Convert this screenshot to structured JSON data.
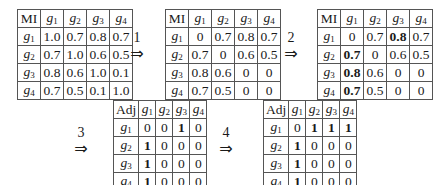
{
  "steps": [
    {
      "label": "1",
      "arrow": "⇒"
    },
    {
      "label": "2",
      "arrow": "⇒"
    },
    {
      "label": "3",
      "arrow": "⇒"
    },
    {
      "label": "4",
      "arrow": "⇒"
    }
  ],
  "matrices": [
    {
      "corner": "MI",
      "col_headers": [
        {
          "base": "g",
          "sub": "1"
        },
        {
          "base": "g",
          "sub": "2"
        },
        {
          "base": "g",
          "sub": "3"
        },
        {
          "base": "g",
          "sub": "4"
        }
      ],
      "row_headers": [
        {
          "base": "g",
          "sub": "1"
        },
        {
          "base": "g",
          "sub": "2"
        },
        {
          "base": "g",
          "sub": "3"
        },
        {
          "base": "g",
          "sub": "4"
        }
      ],
      "rows": [
        [
          "1.0",
          "0.7",
          "0.8",
          "0.7"
        ],
        [
          "0.7",
          "1.0",
          "0.6",
          "0.5"
        ],
        [
          "0.8",
          "0.6",
          "1.0",
          "0.1"
        ],
        [
          "0.7",
          "0.5",
          "0.1",
          "1.0"
        ]
      ],
      "bold": []
    },
    {
      "corner": "MI",
      "col_headers": [
        {
          "base": "g",
          "sub": "1"
        },
        {
          "base": "g",
          "sub": "2"
        },
        {
          "base": "g",
          "sub": "3"
        },
        {
          "base": "g",
          "sub": "4"
        }
      ],
      "row_headers": [
        {
          "base": "g",
          "sub": "1"
        },
        {
          "base": "g",
          "sub": "2"
        },
        {
          "base": "g",
          "sub": "3"
        },
        {
          "base": "g",
          "sub": "4"
        }
      ],
      "rows": [
        [
          "0",
          "0.7",
          "0.8",
          "0.7"
        ],
        [
          "0.7",
          "0",
          "0.6",
          "0.5"
        ],
        [
          "0.8",
          "0.6",
          "0",
          "0"
        ],
        [
          "0.7",
          "0.5",
          "0",
          "0"
        ]
      ],
      "bold": []
    },
    {
      "corner": "MI",
      "col_headers": [
        {
          "base": "g",
          "sub": "1"
        },
        {
          "base": "g",
          "sub": "2"
        },
        {
          "base": "g",
          "sub": "3"
        },
        {
          "base": "g",
          "sub": "4"
        }
      ],
      "row_headers": [
        {
          "base": "g",
          "sub": "1"
        },
        {
          "base": "g",
          "sub": "2"
        },
        {
          "base": "g",
          "sub": "3"
        },
        {
          "base": "g",
          "sub": "4"
        }
      ],
      "rows": [
        [
          "0",
          "0.7",
          "0.8",
          "0.7"
        ],
        [
          "0.7",
          "0",
          "0.6",
          "0.5"
        ],
        [
          "0.8",
          "0.6",
          "0",
          "0"
        ],
        [
          "0.7",
          "0.5",
          "0",
          "0"
        ]
      ],
      "bold": [
        [
          0,
          2
        ],
        [
          1,
          0
        ],
        [
          2,
          0
        ],
        [
          3,
          0
        ]
      ]
    },
    {
      "corner": "Adj",
      "col_headers": [
        {
          "base": "g",
          "sub": "1"
        },
        {
          "base": "g",
          "sub": "2"
        },
        {
          "base": "g",
          "sub": "3"
        },
        {
          "base": "g",
          "sub": "4"
        }
      ],
      "row_headers": [
        {
          "base": "g",
          "sub": "1"
        },
        {
          "base": "g",
          "sub": "2"
        },
        {
          "base": "g",
          "sub": "3"
        },
        {
          "base": "g",
          "sub": "4"
        }
      ],
      "rows": [
        [
          "0",
          "0",
          "1",
          "0"
        ],
        [
          "1",
          "0",
          "0",
          "0"
        ],
        [
          "1",
          "0",
          "0",
          "0"
        ],
        [
          "1",
          "0",
          "0",
          "0"
        ]
      ],
      "bold": [
        [
          0,
          2
        ],
        [
          1,
          0
        ],
        [
          2,
          0
        ],
        [
          3,
          0
        ]
      ]
    },
    {
      "corner": "Adj",
      "col_headers": [
        {
          "base": "g",
          "sub": "1"
        },
        {
          "base": "g",
          "sub": "2"
        },
        {
          "base": "g",
          "sub": "3"
        },
        {
          "base": "g",
          "sub": "4"
        }
      ],
      "row_headers": [
        {
          "base": "g",
          "sub": "1"
        },
        {
          "base": "g",
          "sub": "2"
        },
        {
          "base": "g",
          "sub": "3"
        },
        {
          "base": "g",
          "sub": "4"
        }
      ],
      "rows": [
        [
          "0",
          "1",
          "1",
          "1"
        ],
        [
          "1",
          "0",
          "0",
          "0"
        ],
        [
          "1",
          "0",
          "0",
          "0"
        ],
        [
          "1",
          "0",
          "0",
          "0"
        ]
      ],
      "bold": [
        [
          0,
          1
        ],
        [
          0,
          2
        ],
        [
          0,
          3
        ],
        [
          1,
          0
        ],
        [
          2,
          0
        ],
        [
          3,
          0
        ]
      ]
    }
  ]
}
